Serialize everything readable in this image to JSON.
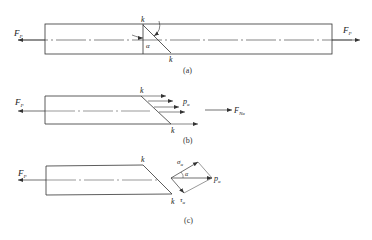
{
  "figure": {
    "panels": [
      {
        "id": "a",
        "caption": "(a)",
        "labels": {
          "force_left": "F",
          "force_left_sub": "P",
          "force_right": "F",
          "force_right_sub": "P",
          "section_top": "k",
          "section_bottom": "k",
          "angle": "α"
        }
      },
      {
        "id": "b",
        "caption": "(b)",
        "labels": {
          "force_left": "F",
          "force_left_sub": "P",
          "stress": "p",
          "stress_sub": "α",
          "section_top": "k",
          "section_bottom": "k",
          "internal_force": "F",
          "internal_force_sub": "Nα"
        }
      },
      {
        "id": "c",
        "caption": "(c)",
        "labels": {
          "force_left": "F",
          "force_left_sub": "P",
          "section_top": "k",
          "section_bottom": "k",
          "normal_stress": "σ",
          "normal_stress_sub": "α",
          "shear_stress": "τ",
          "shear_stress_sub": "α",
          "total_stress": "p",
          "total_stress_sub": "α",
          "angle": "α"
        }
      }
    ],
    "colors": {
      "line": "#333333",
      "background": "#ffffff"
    }
  }
}
